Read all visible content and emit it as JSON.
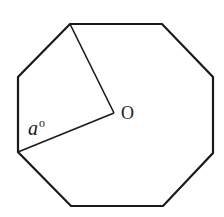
{
  "diagram": {
    "shape": "regular-octagon",
    "stroke_color": "#1a1a1a",
    "background_color": "#ffffff",
    "vertices": [
      [
        70,
        24
      ],
      [
        162,
        24
      ],
      [
        213,
        77
      ],
      [
        213,
        153
      ],
      [
        163,
        206
      ],
      [
        71,
        206
      ],
      [
        18,
        152
      ],
      [
        18,
        77
      ]
    ],
    "center": [
      114,
      113
    ],
    "radii_to_vertices": [
      0,
      6
    ],
    "labels": {
      "center": "O",
      "angle_variable": "a",
      "angle_unit": "o"
    }
  }
}
